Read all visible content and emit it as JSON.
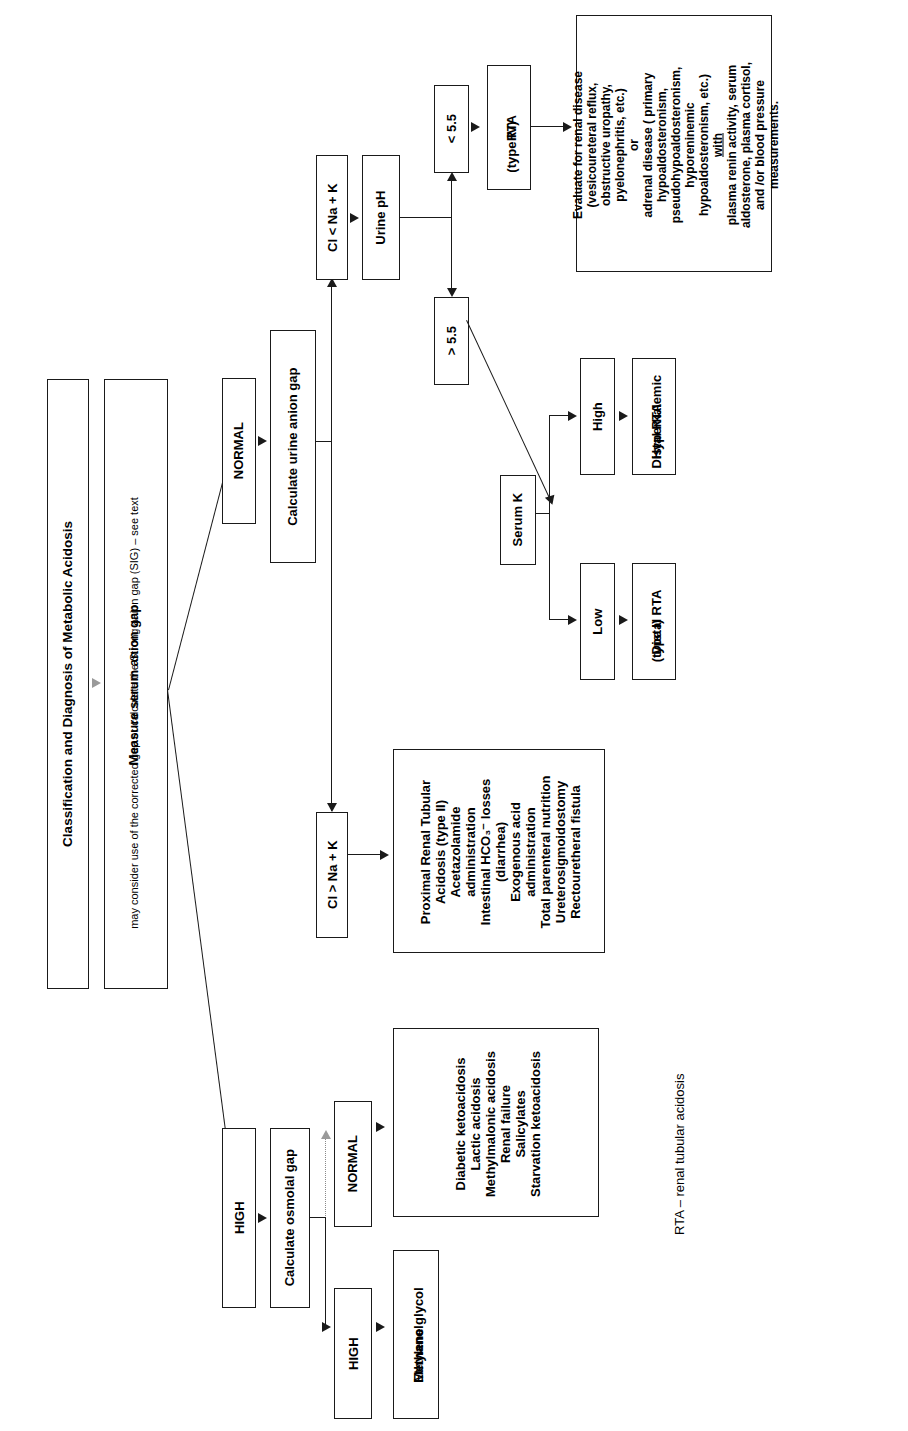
{
  "diagram": {
    "title": "Classification and Diagnosis of Metabolic Acidosis",
    "orientation": "rotated-90-ccw",
    "accent_color": "#1a1a1a",
    "legend": "RTA – renal tubular acidosis",
    "nodes": {
      "title_box": "Classification and Diagnosis of Metabolic Acidosis",
      "measure_box_title": "Measure serum anion gap",
      "measure_box_sub": "may consider use of the corrected gap or calculate the Strong anion gap (SIG) – see text",
      "normal_gap": "NORMAL",
      "high_gap": "HIGH",
      "calculate_urine_anion_gap": "Calculate urine anion gap",
      "cl_lt_na_k": "Cl < Na + K",
      "cl_gt_na_k": "Cl > Na + K",
      "urine_ph": "Urine pH",
      "ph_lt": "< 5.5",
      "ph_gt": "> 5.5",
      "rta_type4_l1": "RTA",
      "rta_type4_l2": "(type IV)",
      "serum_k": "Serum K",
      "k_high": "High",
      "k_low": "Low",
      "hyperkalemic_l1": "Hyperkalemic",
      "hyperkalemic_l2": "Distal RTA",
      "distal_rta_l1": "Distal RTA",
      "distal_rta_l2": "(type I)",
      "calculate_osmolal_gap": "Calculate osmolal gap",
      "osm_normal": "NORMAL",
      "osm_high": "HIGH",
      "ethylene_l1": "Ethylene glycol",
      "ethylene_l2": "Methanol"
    },
    "evaluate_renal_box": {
      "line1": "Evaluate for renal disease",
      "line2": "(vesicoureteral reflux,",
      "line3": "obstructive uropathy,",
      "line4": "pyelonephritis, etc.)",
      "line5": "or",
      "line6": "adrenal disease ( primary",
      "line7": "hypoaldosteronism,",
      "line8": "pseudohypoaldosteronism,",
      "line9": "hyporeninemic",
      "line10": "hypoaldosteronism, etc.)",
      "line11_underlined": "with",
      "line12": "plasma renin activity, serum",
      "line13": "aldosterone, plasma cortisol,",
      "line14": "and /or blood pressure",
      "line15": "measurements."
    },
    "proximal_rta_box": {
      "line1": "Proximal Renal Tubular",
      "line2": "Acidosis (type II)",
      "line3": "Acetazolamide",
      "line4": "administration",
      "line5": "Intestinal HCO₃⁻ losses",
      "line6": "(diarrhea)",
      "line7": "Exogenous acid",
      "line8": "administration",
      "line9": "Total parenteral nutrition",
      "line10": "Ureterosigmoidostomy",
      "line11": "Rectouretheral fistula"
    },
    "high_gap_causes_box": {
      "line1": "Diabetic ketoacidosis",
      "line2": "Lactic acidosis",
      "line3": "Methylmalonic acidosis",
      "line4": "Renal failure",
      "line5": "Salicylates",
      "line6": "Starvation ketoacidosis"
    }
  }
}
